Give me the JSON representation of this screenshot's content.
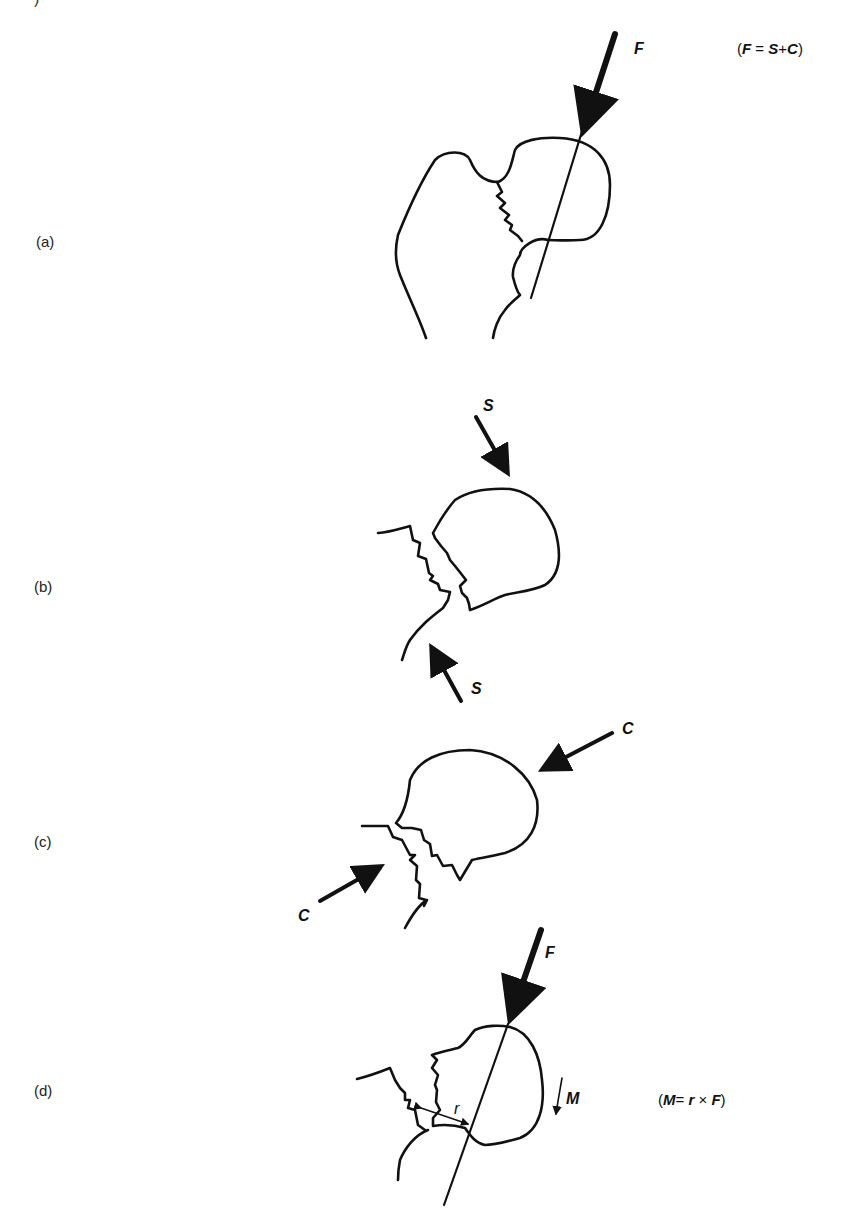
{
  "figure": {
    "cropped_glyph": ")",
    "panels": [
      {
        "id": "a",
        "label": "(a)",
        "equation": {
          "lhs": "F",
          "eq": "=",
          "a": "S",
          "op": "+",
          "b": "C"
        },
        "vectors": [
          {
            "name": "F",
            "label": "F"
          }
        ]
      },
      {
        "id": "b",
        "label": "(b)",
        "vectors": [
          {
            "name": "S-top",
            "label": "S"
          },
          {
            "name": "S-bottom",
            "label": "S"
          }
        ]
      },
      {
        "id": "c",
        "label": "(c)",
        "vectors": [
          {
            "name": "C-right",
            "label": "C"
          },
          {
            "name": "C-left",
            "label": "C"
          }
        ]
      },
      {
        "id": "d",
        "label": "(d)",
        "equation": {
          "lhs": "M",
          "eq": "=",
          "a": "r",
          "op": "×",
          "b": "F"
        },
        "vectors": [
          {
            "name": "F",
            "label": "F"
          },
          {
            "name": "M",
            "label": "M"
          },
          {
            "name": "r",
            "label": "r"
          }
        ]
      }
    ]
  },
  "colors": {
    "ink": "#111111",
    "background": "#ffffff"
  }
}
